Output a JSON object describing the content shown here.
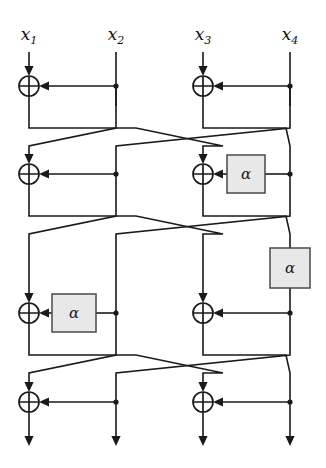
{
  "figure": {
    "kind": "feistel-network-diagram",
    "title": "",
    "background_color": "#ffffff",
    "line_color": "#1a1a1a",
    "box_fill_color": "#e8e8e8",
    "box_stroke_color": "#4a4a4a",
    "width": 326,
    "height": 468
  },
  "inputs": [
    {
      "id": "x1",
      "base": "x",
      "sub": "1",
      "label": "x1",
      "x": 29,
      "y": 40
    },
    {
      "id": "x2",
      "base": "x",
      "sub": "2",
      "label": "x2",
      "x": 116,
      "y": 40
    },
    {
      "id": "x3",
      "base": "x",
      "sub": "3",
      "label": "x3",
      "x": 203,
      "y": 40
    },
    {
      "id": "x4",
      "base": "x",
      "sub": "4",
      "label": "x4",
      "x": 290,
      "y": 40
    }
  ],
  "columns": [
    {
      "id": "col1",
      "x": 29
    },
    {
      "id": "col2",
      "x": 116
    },
    {
      "id": "col3",
      "x": 203
    },
    {
      "id": "col4",
      "x": 290
    }
  ],
  "xor_gates": [
    {
      "id": "xor-r1-left",
      "cx": 29,
      "cy": 86,
      "r": 10
    },
    {
      "id": "xor-r1-right",
      "cx": 203,
      "cy": 86,
      "r": 10
    },
    {
      "id": "xor-r2-left",
      "cx": 29,
      "cy": 174,
      "r": 10
    },
    {
      "id": "xor-r2-right",
      "cx": 203,
      "cy": 174,
      "r": 10
    },
    {
      "id": "xor-r3-left",
      "cx": 29,
      "cy": 313,
      "r": 10
    },
    {
      "id": "xor-r3-right",
      "cx": 203,
      "cy": 313,
      "r": 10
    },
    {
      "id": "xor-r4-left",
      "cx": 29,
      "cy": 402,
      "r": 10
    },
    {
      "id": "xor-r4-right",
      "cx": 203,
      "cy": 402,
      "r": 10
    }
  ],
  "function_boxes": [
    {
      "id": "alpha-r2-right",
      "label": "α",
      "x": 227,
      "y": 155,
      "w": 38,
      "h": 38,
      "orientation": "horizontal"
    },
    {
      "id": "alpha-r3-left",
      "label": "α",
      "x": 52,
      "y": 294,
      "w": 44,
      "h": 38,
      "orientation": "horizontal"
    },
    {
      "id": "alpha-inline-right",
      "label": "α",
      "x": 270,
      "y": 248,
      "w": 40,
      "h": 40,
      "orientation": "vertical"
    }
  ],
  "tap_dots": [
    {
      "id": "tap-r1-c2",
      "cx": 116,
      "cy": 86
    },
    {
      "id": "tap-r1-c4",
      "cx": 290,
      "cy": 86
    },
    {
      "id": "tap-r2-c2",
      "cx": 116,
      "cy": 174
    },
    {
      "id": "tap-r2-c4",
      "cx": 290,
      "cy": 174
    },
    {
      "id": "tap-r3-c2",
      "cx": 116,
      "cy": 313
    },
    {
      "id": "tap-r3-c4",
      "cx": 290,
      "cy": 313
    },
    {
      "id": "tap-r4-c2",
      "cx": 116,
      "cy": 402
    },
    {
      "id": "tap-r4-c4",
      "cx": 290,
      "cy": 402
    }
  ],
  "rounds": [
    {
      "id": "round-1",
      "y": 86,
      "has_alpha_left": false,
      "has_alpha_right": false
    },
    {
      "id": "round-2",
      "y": 174,
      "has_alpha_left": false,
      "has_alpha_right": true
    },
    {
      "id": "round-3",
      "y": 313,
      "has_alpha_left": true,
      "has_alpha_right": false
    },
    {
      "id": "round-4",
      "y": 402,
      "has_alpha_left": false,
      "has_alpha_right": false
    }
  ],
  "permutations": [
    {
      "id": "perm-1",
      "from_y": 106,
      "to_y": 154,
      "mapping": "1->3, 2->1, 3->4, 4->2"
    },
    {
      "id": "perm-2",
      "from_y": 194,
      "to_y": 280,
      "mapping": "1->3, 2->1, 3->4, 4->2"
    },
    {
      "id": "perm-3",
      "from_y": 333,
      "to_y": 382,
      "mapping": "1->3, 2->1, 3->4, 4->2"
    }
  ],
  "outputs": [
    {
      "id": "out1",
      "x": 29,
      "y_end": 446
    },
    {
      "id": "out2",
      "x": 116,
      "y_end": 446
    },
    {
      "id": "out3",
      "x": 203,
      "y_end": 446
    },
    {
      "id": "out4",
      "x": 290,
      "y_end": 446
    }
  ]
}
